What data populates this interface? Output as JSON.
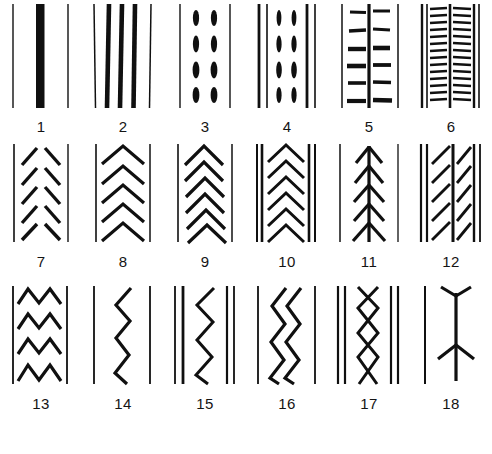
{
  "plate": {
    "title": "Decorative band motifs",
    "columns": 6,
    "rows": 3,
    "background_color": "#ffffff",
    "ink_color": "#101010",
    "caption_color": "#141414",
    "footnote": "",
    "footnote_legible": false
  },
  "figures": [
    {
      "number": "1",
      "row": 1,
      "column": 1,
      "motif": "single-thick-vertical-bar",
      "description": "Two thin vertical border lines flanking one wide solid black vertical bar in the centre.",
      "element_counts": {
        "border_lines": 2,
        "thick_bars": 1
      }
    },
    {
      "number": "2",
      "row": 1,
      "column": 2,
      "motif": "multiple-vertical-stripes",
      "description": "Two thin outer border lines enclosing three heavy vertical stripes.",
      "element_counts": {
        "border_lines": 2,
        "thick_bars": 3
      }
    },
    {
      "number": "3",
      "row": 1,
      "column": 3,
      "motif": "double-column-vertical-dashes",
      "description": "Two thin border lines enclosing two columns of four short vertical oval dashes each.",
      "element_counts": {
        "border_lines": 2,
        "dash_columns": 2,
        "dashes_per_column": 4
      }
    },
    {
      "number": "4",
      "row": 1,
      "column": 4,
      "motif": "vertical-lines-with-dash-columns",
      "description": "Paired heavy vertical lines at each edge with two inner columns of four short vertical dashes.",
      "element_counts": {
        "border_lines": 4,
        "dash_columns": 2,
        "dashes_per_column": 4
      }
    },
    {
      "number": "5",
      "row": 1,
      "column": 5,
      "motif": "centre-line-with-horizontal-ticks",
      "description": "A heavy vertical centre line crossed by six pairs of short horizontal bars, enclosed by thin outer lines.",
      "element_counts": {
        "border_lines": 2,
        "centre_lines": 1,
        "tick_rows": 6
      }
    },
    {
      "number": "6",
      "row": 1,
      "column": 6,
      "motif": "dense-ladder-rungs",
      "description": "Two narrow ladder panels of closely spaced horizontal rungs between heavy vertical rails.",
      "element_counts": {
        "rails": 5,
        "ladder_panels": 2,
        "rungs_per_panel": 13
      }
    },
    {
      "number": "7",
      "row": 2,
      "column": 1,
      "motif": "detached-slanted-strokes",
      "description": "Two thin border lines enclosing two columns of opposed short diagonal strokes, herringbone fashion, not touching.",
      "element_counts": {
        "border_lines": 2,
        "stroke_rows": 5
      }
    },
    {
      "number": "8",
      "row": 2,
      "column": 2,
      "motif": "stacked-chevrons",
      "description": "Two thin border lines enclosing five separate upward-pointing chevrons stacked vertically.",
      "element_counts": {
        "border_lines": 2,
        "chevrons": 5
      }
    },
    {
      "number": "9",
      "row": 2,
      "column": 3,
      "motif": "interlocking-chevrons",
      "description": "Chevrons with extended tails overlapping to form a braided or plaited band between thin border lines.",
      "element_counts": {
        "border_lines": 2,
        "chevrons": 6
      }
    },
    {
      "number": "10",
      "row": 2,
      "column": 4,
      "motif": "chevrons-between-double-rails",
      "description": "Six nested upward chevrons set between doubled heavy vertical rails on both sides.",
      "element_counts": {
        "rails": 4,
        "chevrons": 6
      }
    },
    {
      "number": "11",
      "row": 2,
      "column": 5,
      "motif": "fir-tree-stem",
      "description": "A vertical central stem carrying paired upward-angled branches, a fir-tree or feather motif, flanked by thin lines.",
      "element_counts": {
        "border_lines": 2,
        "stems": 1,
        "branch_pairs": 5
      }
    },
    {
      "number": "12",
      "row": 2,
      "column": 6,
      "motif": "feathered-vertical-lines",
      "description": "Heavy vertical rails with short diagonal feather strokes springing from a central line on both sides.",
      "element_counts": {
        "rails": 4,
        "feather_rows": 5
      }
    },
    {
      "number": "13",
      "row": 3,
      "column": 1,
      "motif": "stacked-zigzag-rows",
      "description": "Four horizontal rows of continuous zigzag between two thin vertical border lines.",
      "element_counts": {
        "border_lines": 2,
        "zigzag_rows": 4
      }
    },
    {
      "number": "14",
      "row": 3,
      "column": 2,
      "motif": "single-vertical-zigzag",
      "description": "One continuous vertical zigzag line running between two widely spaced thin border lines.",
      "element_counts": {
        "border_lines": 2,
        "zigzags": 1
      }
    },
    {
      "number": "15",
      "row": 3,
      "column": 3,
      "motif": "zigzag-with-paired-rails",
      "description": "A single vertical zigzag with two heavy rails to the left and two to the right.",
      "element_counts": {
        "rails": 4,
        "zigzags": 1
      }
    },
    {
      "number": "16",
      "row": 3,
      "column": 4,
      "motif": "double-vertical-zigzag",
      "description": "Two parallel vertical zigzag lines running in phase between thin border lines.",
      "element_counts": {
        "border_lines": 2,
        "zigzags": 2
      }
    },
    {
      "number": "17",
      "row": 3,
      "column": 5,
      "motif": "crossing-zigzags-lozenges",
      "description": "Two opposed vertical zigzags crossing to form a chain of lozenges, with doubled rails at each side.",
      "element_counts": {
        "rails": 4,
        "zigzags": 2,
        "lozenges": 3
      }
    },
    {
      "number": "18",
      "row": 3,
      "column": 6,
      "motif": "forked-stem",
      "description": "A single thin vertical line beside an upright stem forking into a Y at the top and splaying into legs at the base.",
      "element_counts": {
        "border_lines": 1,
        "stems": 1,
        "forks": 2
      }
    }
  ]
}
